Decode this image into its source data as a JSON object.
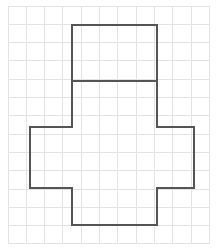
{
  "figure": {
    "type": "geometry-diagram",
    "canvas": {
      "width": 222,
      "height": 251,
      "background": "#ffffff"
    },
    "grid": {
      "name": "square-grid-paper",
      "origin_x": 8,
      "origin_y": 6,
      "cell_size": 18.3,
      "columns": 11,
      "rows": 13,
      "line_color": "#e3e3e3",
      "line_width": 1,
      "visible": true
    },
    "shape": {
      "name": "cube-net",
      "description": "Cross-shaped hexomino net composed of six unit squares",
      "stroke_color": "#555555",
      "stroke_width": 1.6,
      "fill": "none",
      "outline_points": [
        [
          72,
          25
        ],
        [
          157,
          25
        ],
        [
          157,
          127
        ],
        [
          194,
          127
        ],
        [
          194,
          188
        ],
        [
          157,
          188
        ],
        [
          157,
          225
        ],
        [
          72,
          225
        ],
        [
          72,
          188
        ],
        [
          30,
          188
        ],
        [
          30,
          127
        ],
        [
          72,
          127
        ]
      ],
      "interior_lines": [
        {
          "name": "divider-line-upper",
          "x1": 72,
          "y1": 81,
          "x2": 157,
          "y2": 81
        }
      ],
      "faces": [
        {
          "name": "face-top",
          "x": 72,
          "y": 25,
          "w": 85,
          "h": 56
        },
        {
          "name": "face-upper",
          "x": 72,
          "y": 81,
          "w": 85,
          "h": 46
        },
        {
          "name": "face-left",
          "x": 30,
          "y": 127,
          "w": 42,
          "h": 61
        },
        {
          "name": "face-center",
          "x": 72,
          "y": 127,
          "w": 85,
          "h": 61
        },
        {
          "name": "face-right",
          "x": 157,
          "y": 127,
          "w": 37,
          "h": 61
        },
        {
          "name": "face-bottom",
          "x": 72,
          "y": 188,
          "w": 85,
          "h": 37
        }
      ]
    }
  }
}
